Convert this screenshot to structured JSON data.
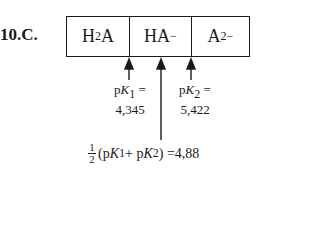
{
  "problem": {
    "label": "10.C."
  },
  "species": [
    {
      "base": "H",
      "sub": "2",
      "tail": "A",
      "sup": ""
    },
    {
      "base": "HA",
      "sub": "",
      "tail": "",
      "sup": "−"
    },
    {
      "base": "A",
      "sub": "",
      "tail": "",
      "sup": "2−"
    }
  ],
  "pk1": {
    "p": "p",
    "k": "K",
    "sub": "1",
    "eq": " =",
    "value": "4,345"
  },
  "pk2": {
    "p": "p",
    "k": "K",
    "sub": "2",
    "eq": " =",
    "value": "5,422"
  },
  "average": {
    "num": "1",
    "den": "2",
    "open": "(p",
    "k1": "K",
    "sub1": "1",
    "plus": " + p",
    "k2": "K",
    "sub2": "2",
    "close": ") = ",
    "value": "4,88"
  }
}
